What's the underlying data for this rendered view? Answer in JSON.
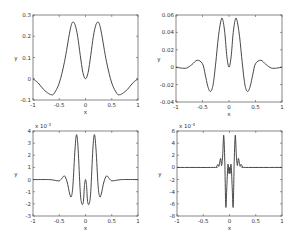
{
  "figure": {
    "layout": "2x2 subplot grid",
    "background": "#ffffff",
    "line_color": "#333333"
  },
  "chart_data": [
    {
      "type": "line",
      "position": "top-left",
      "xlabel": "x",
      "ylabel": "y",
      "xlim": [
        -1,
        1
      ],
      "ylim": [
        -0.1,
        0.3
      ],
      "exponent_label": "",
      "xticks": [
        "-1",
        "-0.5",
        "0",
        "0.5",
        "1"
      ],
      "xtick_values": [
        -1,
        -0.5,
        0,
        0.5,
        1
      ],
      "yticks": [
        "-0.1",
        "0",
        "0.1",
        "0.2",
        "0.3"
      ],
      "ytick_values": [
        -0.1,
        0,
        0.1,
        0.2,
        0.3
      ],
      "frame": {
        "left": 33,
        "top": 15,
        "right": 138,
        "bottom": 100
      },
      "x": [
        -1.0,
        -0.9,
        -0.8,
        -0.7,
        -0.65,
        -0.6,
        -0.5,
        -0.4,
        -0.3,
        -0.25,
        -0.2,
        -0.15,
        -0.1,
        -0.05,
        0.0,
        0.05,
        0.1,
        0.15,
        0.2,
        0.25,
        0.3,
        0.4,
        0.5,
        0.6,
        0.65,
        0.7,
        0.8,
        0.9,
        1.0
      ],
      "y": [
        0.0,
        -0.02,
        -0.05,
        -0.07,
        -0.075,
        -0.07,
        -0.02,
        0.08,
        0.22,
        0.265,
        0.255,
        0.2,
        0.11,
        0.03,
        0.0,
        0.03,
        0.11,
        0.2,
        0.255,
        0.265,
        0.22,
        0.08,
        -0.02,
        -0.07,
        -0.075,
        -0.07,
        -0.05,
        -0.02,
        0.0
      ]
    },
    {
      "type": "line",
      "position": "top-right",
      "xlabel": "x",
      "ylabel": "y",
      "xlim": [
        -1,
        1
      ],
      "ylim": [
        -0.04,
        0.06
      ],
      "exponent_label": "",
      "xticks": [
        "-1",
        "-0.5",
        "0",
        "0.5",
        "1"
      ],
      "xtick_values": [
        -1,
        -0.5,
        0,
        0.5,
        1
      ],
      "yticks": [
        "-0.04",
        "-0.02",
        "0",
        "0.02",
        "0.04",
        "0.06"
      ],
      "ytick_values": [
        -0.04,
        -0.02,
        0,
        0.02,
        0.04,
        0.06
      ],
      "frame": {
        "left": 176,
        "top": 15,
        "right": 282,
        "bottom": 102
      },
      "x": [
        -1.0,
        -0.9,
        -0.8,
        -0.7,
        -0.6,
        -0.5,
        -0.45,
        -0.4,
        -0.35,
        -0.3,
        -0.25,
        -0.2,
        -0.15,
        -0.12,
        -0.08,
        -0.04,
        0.0,
        0.04,
        0.08,
        0.12,
        0.15,
        0.2,
        0.25,
        0.3,
        0.35,
        0.4,
        0.45,
        0.5,
        0.6,
        0.7,
        0.8,
        0.9,
        1.0
      ],
      "y": [
        0.0,
        -0.001,
        -0.001,
        0.003,
        0.008,
        0.004,
        -0.008,
        -0.022,
        -0.028,
        -0.02,
        0.005,
        0.035,
        0.054,
        0.055,
        0.04,
        0.012,
        0.0,
        0.012,
        0.04,
        0.055,
        0.054,
        0.035,
        0.005,
        -0.02,
        -0.028,
        -0.022,
        -0.008,
        0.004,
        0.008,
        0.003,
        -0.001,
        -0.001,
        0.0
      ]
    },
    {
      "type": "line",
      "position": "bottom-left",
      "xlabel": "x",
      "ylabel": "y",
      "xlim": [
        -1,
        1
      ],
      "ylim": [
        -3,
        4
      ],
      "exponent_label": "x 10^-3",
      "xticks": [
        "-1",
        "-0.5",
        "0",
        "0.5",
        "1"
      ],
      "xtick_values": [
        -1,
        -0.5,
        0,
        0.5,
        1
      ],
      "yticks": [
        "-3",
        "-2",
        "-1",
        "0",
        "1",
        "2",
        "3",
        "4"
      ],
      "ytick_values": [
        -3,
        -2,
        -1,
        0,
        1,
        2,
        3,
        4
      ],
      "frame": {
        "left": 33,
        "top": 131,
        "right": 138,
        "bottom": 216
      },
      "x": [
        -1.0,
        -0.7,
        -0.6,
        -0.5,
        -0.45,
        -0.4,
        -0.35,
        -0.3,
        -0.27,
        -0.24,
        -0.2,
        -0.17,
        -0.14,
        -0.1,
        -0.07,
        -0.04,
        -0.02,
        0.0,
        0.02,
        0.04,
        0.07,
        0.1,
        0.14,
        0.17,
        0.2,
        0.24,
        0.27,
        0.3,
        0.35,
        0.4,
        0.45,
        0.5,
        0.6,
        0.7,
        1.0
      ],
      "y": [
        0.0,
        0.0,
        -0.05,
        -0.1,
        0.1,
        0.3,
        -0.2,
        -1.2,
        -1.4,
        -0.5,
        2.5,
        3.7,
        2.5,
        -1.0,
        -2.0,
        -1.8,
        -0.5,
        0.0,
        -0.5,
        -1.8,
        -2.0,
        -1.0,
        2.5,
        3.7,
        2.5,
        -0.5,
        -1.4,
        -1.2,
        -0.2,
        0.3,
        0.1,
        -0.1,
        -0.05,
        0.0,
        0.0
      ]
    },
    {
      "type": "line",
      "position": "bottom-right",
      "xlabel": "x",
      "ylabel": "y",
      "xlim": [
        -1,
        1
      ],
      "ylim": [
        -8,
        6
      ],
      "exponent_label": "x 10^-4",
      "xticks": [
        "-1",
        "-0.5",
        "0",
        "0.5",
        "1"
      ],
      "xtick_values": [
        -1,
        -0.5,
        0,
        0.5,
        1
      ],
      "yticks": [
        "-8",
        "-6",
        "-4",
        "-2",
        "0",
        "2",
        "4",
        "6"
      ],
      "ytick_values": [
        -8,
        -6,
        -4,
        -2,
        0,
        2,
        4,
        6
      ],
      "frame": {
        "left": 177,
        "top": 131,
        "right": 282,
        "bottom": 216
      },
      "x": [
        -1.0,
        -0.3,
        -0.25,
        -0.22,
        -0.2,
        -0.17,
        -0.15,
        -0.13,
        -0.11,
        -0.09,
        -0.07,
        -0.05,
        -0.03,
        -0.01,
        0.0,
        0.01,
        0.03,
        0.05,
        0.07,
        0.09,
        0.11,
        0.13,
        0.15,
        0.17,
        0.2,
        0.22,
        0.25,
        0.3,
        1.0
      ],
      "y": [
        0.0,
        0.0,
        0.1,
        0.5,
        0.2,
        1.5,
        0.3,
        2.0,
        5.3,
        1.0,
        -6.5,
        -3.0,
        0.5,
        -1.0,
        0.0,
        -1.0,
        0.5,
        -3.0,
        -6.5,
        1.0,
        5.3,
        2.0,
        0.3,
        1.5,
        0.2,
        0.5,
        0.1,
        0.0,
        0.0
      ]
    }
  ]
}
